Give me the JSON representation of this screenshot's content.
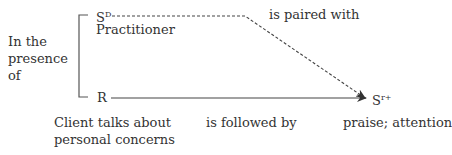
{
  "context": {
    "lines": [
      "In the",
      "presence",
      "of"
    ]
  },
  "sd": {
    "symbol": "S",
    "superscript": "D",
    "description": "Practitioner"
  },
  "response": {
    "symbol": "R",
    "description_lines": [
      "Client talks about",
      "personal concerns"
    ]
  },
  "reinforcer": {
    "symbol": "S",
    "superscript": "r+",
    "description": "praise; attention"
  },
  "relations": {
    "paired_label": "is paired with",
    "followed_label": "is followed by"
  },
  "colors": {
    "text": "#333333",
    "line": "#555555"
  }
}
